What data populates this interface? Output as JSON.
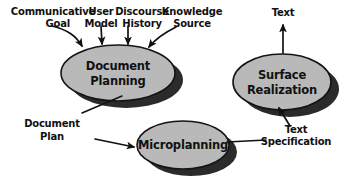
{
  "diagram": {
    "background_color": "#ffffff",
    "ellipse_fill_color": "#b9b9b9",
    "ellipse_stroke_color": "#141414",
    "shadow_color": "#2b2b2b",
    "text_color": "#111111",
    "inputs": [
      {
        "id": "communicative-goal",
        "line1": "Communicative",
        "line2": "Goal"
      },
      {
        "id": "user-model",
        "line1": "User",
        "line2": "Model"
      },
      {
        "id": "discourse-history",
        "line1": "Discourse",
        "line2": "History"
      },
      {
        "id": "knowledge-source",
        "line1": "Knowledge",
        "line2": "Source"
      }
    ],
    "stages": [
      {
        "id": "document-planning",
        "line1": "Document",
        "line2": "Planning"
      },
      {
        "id": "microplanning",
        "line1": "Microplanning",
        "line2": ""
      },
      {
        "id": "surface-realization",
        "line1": "Surface",
        "line2": "Realization"
      }
    ],
    "intermediates": [
      {
        "id": "document-plan",
        "line1": "Document",
        "line2": "Plan"
      },
      {
        "id": "text-specification",
        "line1": "Text",
        "line2": "Specification"
      }
    ],
    "output": {
      "id": "text-output",
      "label": "Text"
    }
  }
}
